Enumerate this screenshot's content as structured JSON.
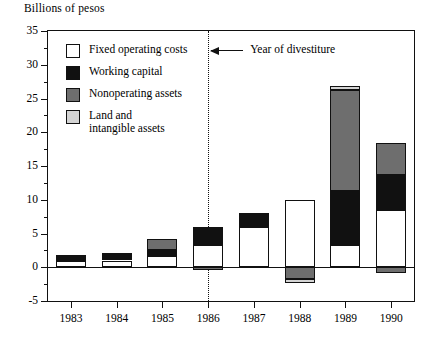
{
  "chart_data": {
    "type": "bar",
    "title": "Billions of pesos",
    "subtitle": "",
    "xlabel": "",
    "ylabel": "Billions of pesos",
    "stacked": true,
    "grid": false,
    "legend_position": "inside-top-left",
    "ylim": [
      -5,
      35
    ],
    "yticks": [
      -5,
      0,
      5,
      10,
      15,
      20,
      25,
      30,
      35
    ],
    "ytick_labels": [
      "-5",
      "0",
      "5",
      "10",
      "15",
      "20",
      "25",
      "30",
      "35"
    ],
    "yticks_minor": [
      -2.5,
      2.5,
      7.5,
      12.5,
      17.5,
      22.5,
      27.5,
      32.5
    ],
    "categories": [
      "1983",
      "1984",
      "1985",
      "1986",
      "1987",
      "1988",
      "1989",
      "1990"
    ],
    "series": [
      {
        "name": "Fixed operating costs",
        "color": "#ffffff",
        "values": [
          0.9,
          1.0,
          1.7,
          3.3,
          6.0,
          9.9,
          3.3,
          8.5
        ]
      },
      {
        "name": "Working capital",
        "color": "#111111",
        "values": [
          0.9,
          1.1,
          0.8,
          2.7,
          2.0,
          0.0,
          8.0,
          5.2
        ]
      },
      {
        "name": "Nonoperating assets",
        "color": "#6e6e6e",
        "values": [
          0.0,
          0.0,
          1.7,
          0.0,
          0.0,
          0.0,
          15.0,
          4.7
        ]
      },
      {
        "name": "Land and intangible assets",
        "color": "#d4d4d4",
        "values": [
          0.0,
          0.0,
          0.0,
          0.0,
          0.0,
          0.0,
          0.5,
          0.0
        ]
      }
    ],
    "negative_series": [
      {
        "name": "Nonoperating assets",
        "color": "#6e6e6e",
        "values": [
          0.0,
          0.0,
          0.0,
          -0.35,
          0.0,
          -1.7,
          0.0,
          -0.9
        ]
      },
      {
        "name": "Land and intangible assets",
        "color": "#d4d4d4",
        "values": [
          0.0,
          0.0,
          0.0,
          0.0,
          0.0,
          -0.6,
          0.0,
          0.0
        ]
      }
    ],
    "totals": [
      1.8,
      2.1,
      4.2,
      6.0,
      8.0,
      9.9,
      26.8,
      18.4
    ],
    "annotations": [
      {
        "name": "year-of-divestiture",
        "text": "Year of divestiture",
        "at_category": "1986",
        "style": "vertical dotted line with left arrow"
      }
    ]
  },
  "legend": {
    "items": [
      {
        "label": "Fixed operating costs",
        "swatch": "#ffffff"
      },
      {
        "label": "Working capital",
        "swatch": "#111111"
      },
      {
        "label": "Nonoperating assets",
        "swatch": "#6e6e6e"
      },
      {
        "label": "Land and\nintangible assets",
        "swatch": "#d4d4d4"
      }
    ]
  }
}
